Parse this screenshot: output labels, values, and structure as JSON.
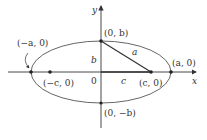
{
  "diagram": {
    "axes": {
      "x_label": "x",
      "y_label": "y",
      "origin_label": "0"
    },
    "points": {
      "left_vertex": "(−a, 0)",
      "right_vertex": "(a, 0)",
      "top_covertex": "(0, b)",
      "bottom_covertex": "(0, −b)",
      "left_focus": "(−c, 0)",
      "right_focus": "(c, 0)"
    },
    "segments": {
      "a": "a",
      "b": "b",
      "c": "c"
    },
    "colors": {
      "stroke": "#333333",
      "background": "#ffffff"
    }
  }
}
